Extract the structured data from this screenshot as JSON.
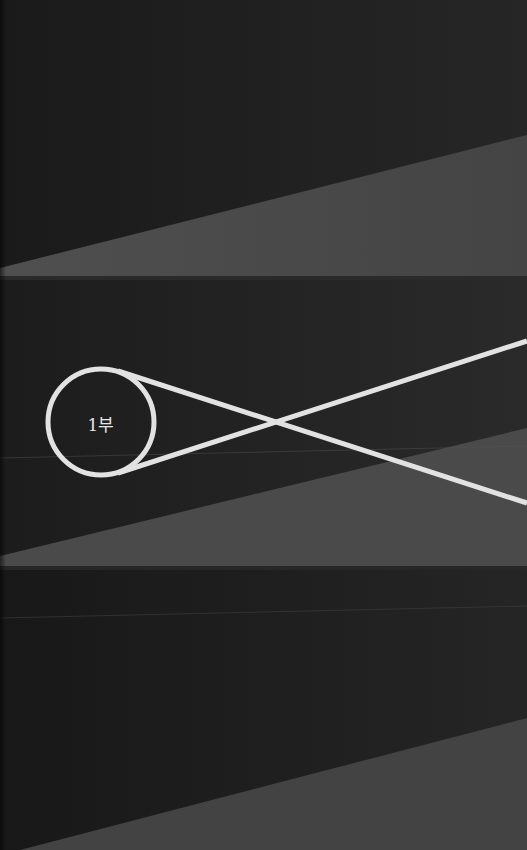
{
  "page": {
    "type": "book section divider",
    "part_label": "1부",
    "colors": {
      "background_dark": "#1e1e1e",
      "wedge_gray": "#4a4a4a",
      "line_white": "#e2e2e2",
      "seam": "#3a3a3a"
    }
  },
  "bands": [
    {
      "top": 0,
      "height": 280
    },
    {
      "top": 280,
      "height": 290
    },
    {
      "top": 570,
      "height": 280
    }
  ],
  "emblem": {
    "circle": {
      "cx": 101,
      "cy": 422,
      "r": 53
    },
    "lines": [
      {
        "from": [
          118,
          371
        ],
        "to": [
          527,
          503
        ]
      },
      {
        "from": [
          118,
          473
        ],
        "to": [
          527,
          341
        ]
      }
    ]
  }
}
